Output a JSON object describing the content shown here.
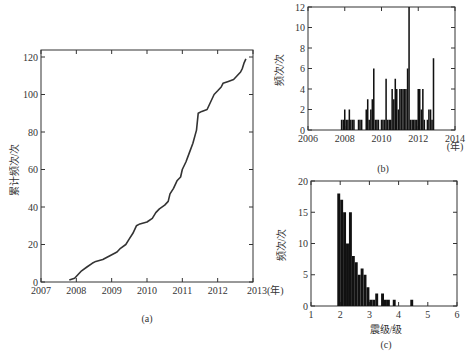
{
  "chart_data": [
    {
      "id": "a",
      "type": "line",
      "caption": "(a)",
      "title": "",
      "xlabel": "(年)",
      "ylabel": "累计频次/次",
      "xlim": [
        2007,
        2013
      ],
      "ylim": [
        0,
        125
      ],
      "xticks": [
        2007,
        2008,
        2009,
        2010,
        2011,
        2012,
        2013
      ],
      "xtick_labels": [
        "2007",
        "2008",
        "2009",
        "2010",
        "2011",
        "2012",
        "2013(年)"
      ],
      "yticks": [
        0,
        20,
        40,
        60,
        80,
        100,
        120
      ],
      "grid": false,
      "series": [
        {
          "name": "累计频次",
          "x": [
            2007.8,
            2007.95,
            2008.05,
            2008.15,
            2008.3,
            2008.45,
            2008.55,
            2008.75,
            2008.95,
            2009.15,
            2009.25,
            2009.4,
            2009.5,
            2009.6,
            2009.7,
            2009.8,
            2010.0,
            2010.15,
            2010.25,
            2010.35,
            2010.5,
            2010.6,
            2010.65,
            2010.75,
            2010.85,
            2010.95,
            2011.0,
            2011.1,
            2011.2,
            2011.3,
            2011.4,
            2011.45,
            2011.55,
            2011.7,
            2011.8,
            2011.9,
            2012.0,
            2012.1,
            2012.15,
            2012.3,
            2012.45,
            2012.55,
            2012.65,
            2012.7,
            2012.75,
            2012.8
          ],
          "y": [
            1,
            2,
            4,
            6,
            8,
            10,
            11,
            12,
            14,
            16,
            18,
            20,
            23,
            26,
            30,
            31,
            32,
            34,
            37,
            39,
            41,
            43,
            47,
            50,
            54,
            56,
            60,
            64,
            69,
            74,
            81,
            90,
            91,
            92,
            96,
            100,
            102,
            104,
            106,
            107,
            108,
            110,
            112,
            114,
            117,
            119
          ]
        }
      ]
    },
    {
      "id": "b",
      "type": "bar",
      "caption": "(b)",
      "title": "",
      "xlabel": "(年)",
      "ylabel": "频次/次",
      "xlim": [
        2006,
        2014
      ],
      "ylim": [
        0,
        12
      ],
      "xticks": [
        2006,
        2008,
        2010,
        2012,
        2014
      ],
      "xtick_labels": [
        "2006",
        "2008",
        "2010",
        "2012",
        "2014"
      ],
      "yticks": [
        0,
        2,
        4,
        6,
        8,
        10,
        12
      ],
      "grid": false,
      "bin_width_years": 0.0833,
      "x": [
        2007.83,
        2007.92,
        2008.0,
        2008.08,
        2008.17,
        2008.25,
        2008.33,
        2008.42,
        2008.5,
        2008.58,
        2008.75,
        2008.83,
        2008.92,
        2009.0,
        2009.17,
        2009.25,
        2009.33,
        2009.42,
        2009.5,
        2009.58,
        2009.67,
        2009.75,
        2009.83,
        2009.92,
        2010.0,
        2010.08,
        2010.17,
        2010.25,
        2010.33,
        2010.42,
        2010.5,
        2010.58,
        2010.67,
        2010.75,
        2010.83,
        2010.92,
        2011.0,
        2011.08,
        2011.17,
        2011.25,
        2011.33,
        2011.42,
        2011.5,
        2011.58,
        2011.67,
        2011.75,
        2011.83,
        2011.92,
        2012.0,
        2012.08,
        2012.17,
        2012.25,
        2012.33,
        2012.42,
        2012.5,
        2012.58,
        2012.67,
        2012.75,
        2012.83
      ],
      "values": [
        1,
        1,
        2,
        1,
        1,
        2,
        1,
        1,
        1,
        0,
        1,
        1,
        1,
        0,
        2,
        3,
        1,
        2,
        3,
        6,
        1,
        1,
        1,
        0,
        1,
        1,
        1,
        5,
        1,
        1,
        1,
        4,
        3,
        5,
        4,
        2,
        4,
        4,
        4,
        4,
        4,
        6,
        12,
        1,
        1,
        1,
        1,
        1,
        4,
        4,
        2,
        4,
        1,
        0,
        1,
        2,
        2,
        1,
        7
      ]
    },
    {
      "id": "c",
      "type": "bar",
      "caption": "(c)",
      "title": "",
      "xlabel": "震级/级",
      "ylabel": "频次/次",
      "xlim": [
        1,
        6
      ],
      "ylim": [
        0,
        20
      ],
      "xticks": [
        1,
        2,
        3,
        4,
        5,
        6
      ],
      "xtick_labels": [
        "1",
        "2",
        "3",
        "4",
        "5",
        "6"
      ],
      "yticks": [
        0,
        5,
        10,
        15,
        20
      ],
      "grid": false,
      "bin_width": 0.1,
      "x": [
        1.95,
        2.05,
        2.15,
        2.25,
        2.35,
        2.45,
        2.55,
        2.65,
        2.75,
        2.85,
        2.95,
        3.05,
        3.15,
        3.25,
        3.35,
        3.45,
        3.55,
        3.65,
        3.75,
        3.85,
        3.95,
        4.05,
        4.15,
        4.25,
        4.35,
        4.45,
        4.55
      ],
      "values": [
        18,
        17,
        15,
        10,
        15,
        8,
        7,
        5,
        6,
        5,
        3,
        1,
        1,
        2,
        0,
        2,
        1,
        1,
        0,
        1,
        0,
        0,
        0,
        0,
        0,
        1,
        0
      ]
    }
  ]
}
